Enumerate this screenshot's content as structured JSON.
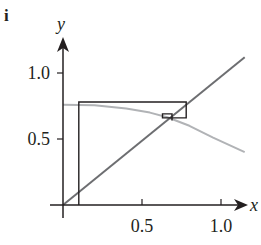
{
  "panel_label": "i",
  "chart_data": {
    "type": "line",
    "title": "",
    "xlabel": "x",
    "ylabel": "y",
    "xlim": [
      0,
      1.15
    ],
    "ylim": [
      0,
      1.25
    ],
    "grid": false,
    "legend": "none",
    "x_ticks": [
      {
        "value": 0.5,
        "label": "0.5"
      },
      {
        "value": 1.0,
        "label": "1.0"
      }
    ],
    "y_ticks": [
      {
        "value": 0.5,
        "label": "0.5"
      },
      {
        "value": 1.0,
        "label": "1.0"
      }
    ],
    "series": [
      {
        "name": "identity line y = x",
        "color": "#6d6e71",
        "points": [
          [
            0,
            0
          ],
          [
            1.15,
            1.12
          ]
        ]
      },
      {
        "name": "map curve f(x)",
        "color": "#b1b3b6",
        "points": [
          [
            0,
            0.76
          ],
          [
            0.2,
            0.755
          ],
          [
            0.4,
            0.73
          ],
          [
            0.55,
            0.7
          ],
          [
            0.66,
            0.665
          ],
          [
            0.8,
            0.6
          ],
          [
            0.95,
            0.51
          ],
          [
            1.15,
            0.4
          ]
        ]
      },
      {
        "name": "cobweb iteration",
        "color": "#231f20",
        "points": [
          [
            0.1,
            0
          ],
          [
            0.1,
            0.78
          ],
          [
            0.78,
            0.78
          ],
          [
            0.78,
            0.66
          ],
          [
            0.63,
            0.66
          ],
          [
            0.63,
            0.69
          ],
          [
            0.69,
            0.69
          ],
          [
            0.69,
            0.64
          ]
        ]
      }
    ],
    "annotations": [
      {
        "type": "rect",
        "x0": 0.1,
        "x1": 0.78,
        "y0": 0.66,
        "y1": 0.78,
        "note": "first cobweb loop"
      },
      {
        "type": "rect",
        "x0": 0.63,
        "x1": 0.69,
        "y0": 0.64,
        "y1": 0.69,
        "note": "inner cobweb loop converging to fixed point"
      }
    ],
    "fixed_point": {
      "x": 0.66,
      "y": 0.66
    }
  }
}
